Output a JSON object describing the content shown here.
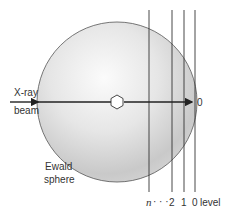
{
  "diagram": {
    "beam_label_line1": "X-ray",
    "beam_label_line2": "beam",
    "sphere_label_line1": "Ewald",
    "sphere_label_line2": "sphere",
    "origin_label": "0",
    "levels": {
      "n_label": "n",
      "dots": "· · ·",
      "level_2": "2",
      "level_1": "1",
      "level_0": "0",
      "suffix": "level"
    },
    "center_icon": "hexagon-crystal-icon",
    "colors": {
      "line": "#222222",
      "sphere_edge": "#555555",
      "sphere_light": "#f4f4f4",
      "sphere_dark": "#c8c8c8",
      "text": "#333333"
    }
  }
}
